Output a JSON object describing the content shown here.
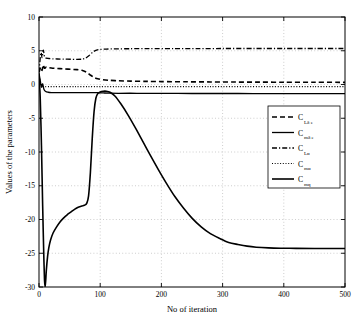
{
  "chart_data": {
    "type": "line",
    "title": "",
    "xlabel": "No of iteration",
    "ylabel": "Values of the parameters",
    "xlim": [
      0,
      500
    ],
    "ylim": [
      -30,
      10
    ],
    "xticks": [
      0,
      100,
      200,
      300,
      400,
      500
    ],
    "yticks": [
      10,
      5,
      0,
      -5,
      -10,
      -15,
      -20,
      -25,
      -30
    ],
    "xtick_labels": [
      "0",
      "100",
      "200",
      "300",
      "400",
      "500"
    ],
    "ytick_labels": [
      "10",
      "5",
      "0",
      "-5",
      "-10",
      "-15",
      "-20",
      "-25",
      "-30"
    ],
    "grid": true,
    "legend_position": "center-right",
    "series": [
      {
        "name": "C_Ldeltae",
        "legend_base": "C",
        "legend_sub": "Lδ e",
        "style": "dashed",
        "color": "#000000",
        "x": [
          0,
          3,
          5,
          7,
          9,
          12,
          16,
          20,
          26,
          34,
          42,
          52,
          62,
          70,
          78,
          84,
          90,
          96,
          104,
          115,
          130,
          150,
          175,
          200,
          240,
          280,
          320,
          360,
          400,
          450,
          500
        ],
        "y": [
          1.8,
          2.6,
          2.1,
          2.9,
          2.4,
          2.6,
          2.5,
          2.45,
          2.4,
          2.35,
          2.3,
          2.25,
          2.2,
          2.1,
          1.8,
          1.4,
          1.05,
          0.85,
          0.72,
          0.62,
          0.55,
          0.5,
          0.46,
          0.43,
          0.4,
          0.38,
          0.36,
          0.35,
          0.34,
          0.33,
          0.32
        ]
      },
      {
        "name": "C_mdeltae",
        "legend_base": "C",
        "legend_sub": "mδ e",
        "style": "solid",
        "color": "#000000",
        "x": [
          0,
          2,
          4,
          6,
          8,
          11,
          15,
          20,
          30,
          45,
          60,
          75,
          85,
          92,
          98,
          105,
          115,
          130,
          160,
          200,
          250,
          300,
          350,
          400,
          450,
          500
        ],
        "y": [
          1.7,
          0.6,
          -0.4,
          0.1,
          -0.7,
          -1.05,
          -1.15,
          -1.2,
          -1.2,
          -1.2,
          -1.2,
          -1.2,
          -1.2,
          -1.2,
          -1.22,
          -1.25,
          -1.28,
          -1.3,
          -1.3,
          -1.32,
          -1.33,
          -1.33,
          -1.34,
          -1.34,
          -1.34,
          -1.34
        ]
      },
      {
        "name": "C_Lalpha",
        "legend_base": "C",
        "legend_sub": "Lα",
        "style": "dashdot",
        "color": "#000000",
        "x": [
          0,
          3,
          5,
          7,
          9,
          12,
          16,
          22,
          30,
          40,
          52,
          62,
          70,
          76,
          82,
          88,
          94,
          100,
          110,
          125,
          150,
          180,
          220,
          260,
          300,
          350,
          400,
          450,
          500
        ],
        "y": [
          1.8,
          4.7,
          4.0,
          5.1,
          4.1,
          3.9,
          3.85,
          3.8,
          3.78,
          3.76,
          3.74,
          3.72,
          3.75,
          3.9,
          4.3,
          4.8,
          5.1,
          5.2,
          5.25,
          5.28,
          5.3,
          5.31,
          5.32,
          5.32,
          5.33,
          5.33,
          5.33,
          5.33,
          5.33
        ]
      },
      {
        "name": "C_malpha",
        "legend_base": "C",
        "legend_sub": "mα",
        "style": "dotted",
        "color": "#000000",
        "x": [
          0,
          3,
          6,
          10,
          16,
          25,
          40,
          60,
          80,
          100,
          130,
          170,
          220,
          280,
          340,
          400,
          450,
          500
        ],
        "y": [
          1.2,
          0.1,
          -0.28,
          -0.3,
          -0.3,
          -0.3,
          -0.3,
          -0.3,
          -0.3,
          -0.3,
          -0.3,
          -0.3,
          -0.3,
          -0.3,
          -0.3,
          -0.3,
          -0.3,
          -0.3
        ]
      },
      {
        "name": "C_mq",
        "legend_base": "C",
        "legend_sub": "mq",
        "style": "solid-thick",
        "color": "#000000",
        "x": [
          0,
          2,
          4,
          6,
          8,
          9,
          10,
          11,
          12,
          14,
          16,
          19,
          23,
          28,
          34,
          40,
          46,
          52,
          58,
          64,
          70,
          74,
          78,
          81,
          84,
          87,
          90,
          93,
          96,
          100,
          105,
          110,
          116,
          124,
          134,
          146,
          158,
          170,
          182,
          195,
          208,
          222,
          236,
          250,
          265,
          280,
          295,
          310,
          325,
          340,
          355,
          375,
          395,
          420,
          450,
          500
        ],
        "y": [
          1.6,
          -2.0,
          -9.0,
          -18.0,
          -26.0,
          -29.0,
          -30.0,
          -29.0,
          -27.5,
          -25.5,
          -24.2,
          -23.0,
          -22.0,
          -21.2,
          -20.4,
          -19.8,
          -19.3,
          -18.9,
          -18.5,
          -18.2,
          -18.0,
          -17.9,
          -17.6,
          -16.5,
          -13.0,
          -8.0,
          -4.0,
          -2.0,
          -1.35,
          -1.1,
          -1.0,
          -1.0,
          -1.15,
          -1.7,
          -2.9,
          -4.6,
          -6.5,
          -8.5,
          -10.5,
          -12.6,
          -14.6,
          -16.6,
          -18.3,
          -19.8,
          -21.1,
          -22.1,
          -22.8,
          -23.4,
          -23.7,
          -23.95,
          -24.1,
          -24.2,
          -24.25,
          -24.28,
          -24.3,
          -24.3
        ]
      }
    ]
  }
}
